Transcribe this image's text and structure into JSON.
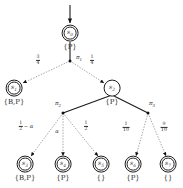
{
  "diagram": {
    "type": "mdp-transition-tree",
    "title": "",
    "colors": {
      "node_stroke": "#1a1a1a",
      "solid_edge": "#1a1a1a",
      "dotted_edge": "#9a9a9a",
      "text": "#2b2b2b"
    },
    "nodes": [
      {
        "id": "s0",
        "label": "s",
        "sub": "0",
        "set": "{P}",
        "x": 70,
        "y": 33,
        "r": 8.4,
        "double": true
      },
      {
        "id": "s1",
        "label": "s",
        "sub": "1",
        "set": "{B,P}",
        "x": 14,
        "y": 88,
        "r": 8.4,
        "double": true
      },
      {
        "id": "s2",
        "label": "s",
        "sub": "2",
        "set": "{P}",
        "x": 112,
        "y": 88,
        "r": 8.4,
        "double": false
      },
      {
        "id": "s3",
        "label": "s",
        "sub": "3",
        "set": "{B,P}",
        "x": 25,
        "y": 164,
        "r": 8.4,
        "double": true
      },
      {
        "id": "s4",
        "label": "s",
        "sub": "4",
        "set": "{P}",
        "x": 63,
        "y": 164,
        "r": 8.4,
        "double": true
      },
      {
        "id": "s5",
        "label": "s",
        "sub": "5",
        "set": "{}",
        "x": 101,
        "y": 164,
        "r": 8.4,
        "double": true
      },
      {
        "id": "s6",
        "label": "s",
        "sub": "6",
        "set": "{P}",
        "x": 133,
        "y": 164,
        "r": 8.4,
        "double": true
      },
      {
        "id": "s7",
        "label": "s",
        "sub": "7",
        "set": "{}",
        "x": 168,
        "y": 164,
        "r": 8.4,
        "double": true
      }
    ],
    "action_nodes": [
      {
        "id": "pi1",
        "label": "π",
        "sub": "1",
        "x": 70,
        "y": 61,
        "label_x": 79,
        "label_y": 58
      },
      {
        "id": "pi2",
        "label": "π",
        "sub": "2",
        "x": 63,
        "y": 113,
        "label_x": 58,
        "label_y": 104
      },
      {
        "id": "pi3",
        "label": "π",
        "sub": "3",
        "x": 148,
        "y": 113,
        "label_x": 152,
        "label_y": 104
      }
    ],
    "probabilities": [
      {
        "id": "p-s0-pi1-s1",
        "from": "pi1",
        "to": "s1",
        "num": "3",
        "den": "4",
        "extra": "",
        "x": 38,
        "y": 60
      },
      {
        "id": "p-s0-pi1-s2",
        "from": "pi1",
        "to": "s2",
        "num": "1",
        "den": "4",
        "extra": "",
        "x": 92,
        "y": 60
      },
      {
        "id": "p-pi2-s3",
        "from": "pi2",
        "to": "s3",
        "num": "1",
        "den": "2",
        "extra": "− α",
        "x": 26,
        "y": 126
      },
      {
        "id": "p-pi2-s4",
        "from": "pi2",
        "to": "s4",
        "num": "",
        "den": "",
        "extra": "α",
        "x": 57,
        "y": 131
      },
      {
        "id": "p-pi2-s5",
        "from": "pi2",
        "to": "s5",
        "num": "1",
        "den": "2",
        "extra": "",
        "x": 86,
        "y": 126
      },
      {
        "id": "p-pi3-s6",
        "from": "pi3",
        "to": "s6",
        "num": "1",
        "den": "10",
        "extra": "",
        "x": 126,
        "y": 127
      },
      {
        "id": "p-pi3-s7",
        "from": "pi3",
        "to": "s7",
        "num": "9",
        "den": "10",
        "extra": "",
        "x": 164,
        "y": 127
      }
    ],
    "edges": [
      {
        "id": "entry-arrow",
        "style": "solid",
        "from_x": 70,
        "from_y": 5,
        "to_x": 70,
        "to_y": 23,
        "arrow": true
      },
      {
        "id": "s0-pi1",
        "style": "solid",
        "from_x": 70,
        "from_y": 42,
        "to_x": 70,
        "to_y": 61,
        "arrow": false
      },
      {
        "id": "pi1-s1",
        "style": "dotted",
        "from_x": 70,
        "from_y": 61,
        "to_x": 23,
        "to_y": 83,
        "arrow": true
      },
      {
        "id": "pi1-s2",
        "style": "dotted",
        "from_x": 70,
        "from_y": 61,
        "to_x": 104,
        "to_y": 83,
        "arrow": true
      },
      {
        "id": "s2-pi2",
        "style": "solid",
        "from_x": 112,
        "from_y": 95,
        "to_x": 63,
        "to_y": 113,
        "arrow": false
      },
      {
        "id": "s2-pi3",
        "style": "solid",
        "from_x": 112,
        "from_y": 95,
        "to_x": 148,
        "to_y": 113,
        "arrow": false
      },
      {
        "id": "pi2-s3",
        "style": "dotted",
        "from_x": 63,
        "from_y": 113,
        "to_x": 31,
        "to_y": 156,
        "arrow": true
      },
      {
        "id": "pi2-s4",
        "style": "dotted",
        "from_x": 63,
        "from_y": 113,
        "to_x": 63,
        "to_y": 156,
        "arrow": true
      },
      {
        "id": "pi2-s5",
        "style": "dotted",
        "from_x": 63,
        "from_y": 113,
        "to_x": 98,
        "to_y": 156,
        "arrow": true
      },
      {
        "id": "pi3-s6",
        "style": "dotted",
        "from_x": 148,
        "from_y": 113,
        "to_x": 136,
        "to_y": 156,
        "arrow": true
      },
      {
        "id": "pi3-s7",
        "style": "dotted",
        "from_x": 148,
        "from_y": 113,
        "to_x": 166,
        "to_y": 156,
        "arrow": true
      }
    ]
  }
}
